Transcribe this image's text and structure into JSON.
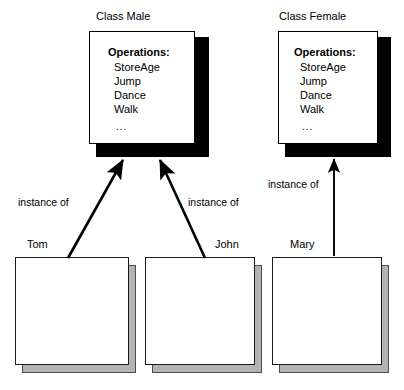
{
  "diagram": {
    "background_color": "#ffffff",
    "line_color": "#000000",
    "class_shadow_color": "#000000",
    "instance_shadow_color": "#b3b3b3"
  },
  "classes": [
    {
      "id": "male",
      "title": "Class Male",
      "operations_heading": "Operations:",
      "operations": [
        "StoreAge",
        "Jump",
        "Dance",
        "Walk"
      ],
      "ellipsis": "..."
    },
    {
      "id": "female",
      "title": "Class Female",
      "operations_heading": "Operations:",
      "operations": [
        "StoreAge",
        "Jump",
        "Dance",
        "Walk"
      ],
      "ellipsis": "..."
    }
  ],
  "instances": [
    {
      "id": "tom",
      "title": "Tom"
    },
    {
      "id": "john",
      "title": "John"
    },
    {
      "id": "mary",
      "title": "Mary"
    }
  ],
  "relations": [
    {
      "id": "tom-male",
      "label": "instance of",
      "from": "tom",
      "to": "male"
    },
    {
      "id": "john-male",
      "label": "instance of",
      "from": "john",
      "to": "male"
    },
    {
      "id": "mary-female",
      "label": "instance of",
      "from": "mary",
      "to": "female"
    }
  ]
}
